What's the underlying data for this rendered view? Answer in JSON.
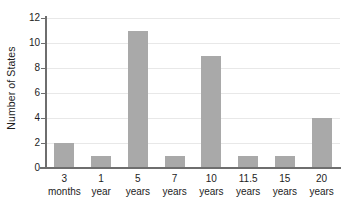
{
  "chart_data": {
    "type": "bar",
    "title": "",
    "subtitle": "",
    "xlabel": "",
    "ylabel": "Number of States",
    "categories": [
      "3 months",
      "1 year",
      "5 years",
      "7 years",
      "10 years",
      "11.5 years",
      "15 years",
      "20 years"
    ],
    "category_lines": [
      {
        "line1": "3",
        "line2": "months"
      },
      {
        "line1": "1",
        "line2": "year"
      },
      {
        "line1": "5",
        "line2": "years"
      },
      {
        "line1": "7",
        "line2": "years"
      },
      {
        "line1": "10",
        "line2": "years"
      },
      {
        "line1": "11.5",
        "line2": "years"
      },
      {
        "line1": "15",
        "line2": "years"
      },
      {
        "line1": "20",
        "line2": "years"
      }
    ],
    "values": [
      2,
      1,
      11,
      1,
      9,
      1,
      1,
      4
    ],
    "ylim": [
      0,
      12
    ],
    "ytick_labels": [
      "0",
      "2",
      "4",
      "6",
      "8",
      "10",
      "12"
    ],
    "ytick_values": [
      0,
      2,
      4,
      6,
      8,
      10,
      12
    ],
    "grid": true,
    "legend": "none",
    "colors": {
      "bar": "#a9a9a9",
      "gridline": "#e8e8e8",
      "axis": "#6e6e6e",
      "text": "#1d1d1d",
      "background": "#ffffff"
    }
  }
}
